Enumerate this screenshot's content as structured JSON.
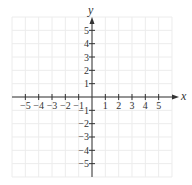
{
  "chart_data": {
    "type": "scatter",
    "title": "",
    "xlabel": "x",
    "ylabel": "y",
    "xlim": [
      -6,
      6
    ],
    "ylim": [
      -6,
      6
    ],
    "grid": true,
    "x_ticks": [
      -5,
      -4,
      -3,
      -2,
      -1,
      1,
      2,
      3,
      4,
      5
    ],
    "y_ticks": [
      -5,
      -4,
      -3,
      -2,
      -1,
      1,
      2,
      3,
      4,
      5
    ],
    "x_tick_labels": [
      "−5",
      "−4",
      "−3",
      "−2",
      "−1",
      "1",
      "2",
      "3",
      "4",
      "5"
    ],
    "y_tick_labels": [
      "−5",
      "−4",
      "−3",
      "−2",
      "−1",
      "1",
      "2",
      "3",
      "4",
      "5"
    ],
    "series": []
  },
  "axes": {
    "x_label": "x",
    "y_label": "y"
  },
  "colors": {
    "grid": "#ececec",
    "axis": "#333333"
  }
}
